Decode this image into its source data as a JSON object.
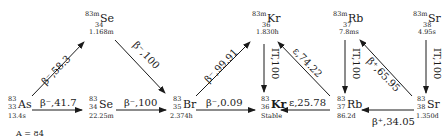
{
  "nuclides": [
    {
      "id": "as83",
      "mass": "83",
      "z": "33",
      "symbol": "As",
      "halflife": "13.4s"
    },
    {
      "id": "se83m",
      "mass": "83m",
      "z": "34",
      "symbol": "Se",
      "halflife": "1.168m"
    },
    {
      "id": "se83",
      "mass": "83",
      "z": "34",
      "symbol": "Se",
      "halflife": "22.25m"
    },
    {
      "id": "br83",
      "mass": "83",
      "z": "35",
      "symbol": "Br",
      "halflife": "2.374h"
    },
    {
      "id": "kr83m",
      "mass": "83m",
      "z": "36",
      "symbol": "Kr",
      "halflife": "1.830h"
    },
    {
      "id": "kr83",
      "mass": "83",
      "z": "36",
      "symbol": "Kr",
      "halflife": "Stable"
    },
    {
      "id": "rb83m",
      "mass": "83m",
      "z": "37",
      "symbol": "Rb",
      "halflife": "7.8ms"
    },
    {
      "id": "rb83",
      "mass": "83",
      "z": "37",
      "symbol": "Rb",
      "halflife": "86.2d"
    },
    {
      "id": "sr83m",
      "mass": "83m",
      "z": "38",
      "symbol": "Sr",
      "halflife": "4.95s"
    },
    {
      "id": "sr83",
      "mass": "83",
      "z": "38",
      "symbol": "Sr",
      "halflife": "1.350d"
    }
  ],
  "decays": [
    {
      "from": "as83",
      "to": "se83m",
      "label": "β⁻,58.3"
    },
    {
      "from": "as83",
      "to": "se83",
      "label": "β⁻,41.7"
    },
    {
      "from": "se83m",
      "to": "br83",
      "label": "β⁻,100"
    },
    {
      "from": "se83",
      "to": "br83",
      "label": "β⁻,100"
    },
    {
      "from": "br83",
      "to": "kr83m",
      "label": "β⁻,99.91"
    },
    {
      "from": "br83",
      "to": "kr83",
      "label": "β⁻,0.09"
    },
    {
      "from": "kr83m",
      "to": "kr83",
      "label": "IT,100"
    },
    {
      "from": "rb83",
      "to": "kr83m",
      "label": "ε,74.22"
    },
    {
      "from": "rb83",
      "to": "kr83",
      "label": "ε,25.78"
    },
    {
      "from": "rb83m",
      "to": "rb83",
      "label": "IT,100"
    },
    {
      "from": "sr83",
      "to": "rb83m",
      "label": "β⁺,65.95"
    },
    {
      "from": "sr83",
      "to": "rb83",
      "label": "β⁺,34.05"
    },
    {
      "from": "sr83m",
      "to": "sr83",
      "label": "IT,100"
    }
  ],
  "footer_fragment": "A  = 84"
}
